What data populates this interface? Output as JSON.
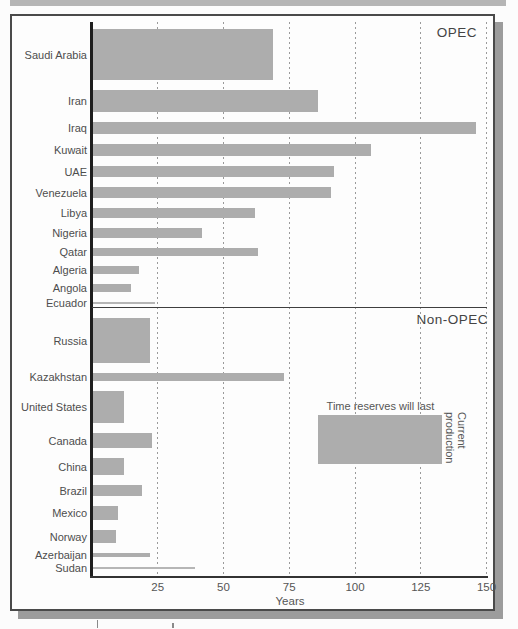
{
  "labels": {
    "opec": "OPEC",
    "non_opec": "Non-OPEC",
    "years_axis": "Years",
    "legend_width": "Time reserves will last",
    "legend_height": "Current production"
  },
  "axis": {
    "ticks": [
      "25",
      "50",
      "75",
      "100",
      "125",
      "150"
    ],
    "tick_values": [
      25,
      50,
      75,
      100,
      125,
      150
    ],
    "max": 150
  },
  "colors": {
    "bar": "#adadad",
    "thin_bar": "#b6b6b6",
    "frame": "#4a4a4a",
    "shadow": "#9c9c9c",
    "text": "#4d4d4d",
    "grid": "#9a9a9a"
  },
  "legend": {
    "bar_span_years": [
      86,
      133
    ],
    "bar_thickness_px": 49
  },
  "chart_data": {
    "type": "bar",
    "orientation": "horizontal",
    "xlabel": "Years",
    "xlim": [
      0,
      150
    ],
    "grid": "dashed-vertical",
    "encoding": {
      "bar_length": "Time reserves will last (years)",
      "bar_thickness": "Current production"
    },
    "sections": [
      {
        "name": "OPEC",
        "items": [
          {
            "label": "Saudi Arabia",
            "years": 69,
            "thickness_px": 51
          },
          {
            "label": "Iran",
            "years": 86,
            "thickness_px": 22
          },
          {
            "label": "Iraq",
            "years": 146,
            "thickness_px": 12
          },
          {
            "label": "Kuwait",
            "years": 106,
            "thickness_px": 12
          },
          {
            "label": "UAE",
            "years": 92,
            "thickness_px": 11
          },
          {
            "label": "Venezuela",
            "years": 91,
            "thickness_px": 11
          },
          {
            "label": "Libya",
            "years": 62,
            "thickness_px": 10
          },
          {
            "label": "Nigeria",
            "years": 42,
            "thickness_px": 10
          },
          {
            "label": "Qatar",
            "years": 63,
            "thickness_px": 8
          },
          {
            "label": "Algeria",
            "years": 18,
            "thickness_px": 8
          },
          {
            "label": "Angola",
            "years": 15,
            "thickness_px": 8
          },
          {
            "label": "Ecuador",
            "years": 24,
            "thickness_px": 2
          }
        ]
      },
      {
        "name": "Non-OPEC",
        "items": [
          {
            "label": "Russia",
            "years": 22,
            "thickness_px": 45
          },
          {
            "label": "Kazakhstan",
            "years": 73,
            "thickness_px": 8
          },
          {
            "label": "United States",
            "years": 12,
            "thickness_px": 32
          },
          {
            "label": "Canada",
            "years": 23,
            "thickness_px": 15
          },
          {
            "label": "China",
            "years": 12,
            "thickness_px": 17
          },
          {
            "label": "Brazil",
            "years": 19,
            "thickness_px": 11
          },
          {
            "label": "Mexico",
            "years": 10,
            "thickness_px": 14
          },
          {
            "label": "Norway",
            "years": 9,
            "thickness_px": 13
          },
          {
            "label": "Azerbaijan",
            "years": 22,
            "thickness_px": 4
          },
          {
            "label": "Sudan",
            "years": 39,
            "thickness_px": 2
          }
        ]
      }
    ]
  }
}
